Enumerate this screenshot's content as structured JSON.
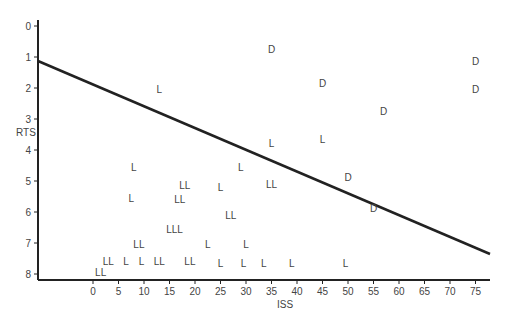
{
  "chart_data": {
    "type": "scatter",
    "title": "",
    "xlabel": "ISS",
    "ylabel": "RTS",
    "xlim": [
      -7,
      78
    ],
    "ylim": [
      8.2,
      -0.2
    ],
    "y_inverted": true,
    "grid": false,
    "legend": null,
    "x_ticks": [
      "0",
      "5",
      "10",
      "15",
      "20",
      "25",
      "30",
      "35",
      "40",
      "45",
      "50",
      "55",
      "60",
      "65",
      "70",
      "75"
    ],
    "y_ticks": [
      "0",
      "1",
      "2",
      "3",
      "4",
      "5",
      "6",
      "7",
      "8"
    ],
    "discriminant_line": {
      "x1": -7,
      "y1": 1.1,
      "x2": 77,
      "y2": 7.3
    },
    "series": [
      {
        "name": "D",
        "points": [
          {
            "x": 35,
            "y": 0.75,
            "label": "D"
          },
          {
            "x": 45,
            "y": 1.85,
            "label": "D"
          },
          {
            "x": 75,
            "y": 1.15,
            "label": "D"
          },
          {
            "x": 75,
            "y": 2.05,
            "label": "D"
          },
          {
            "x": 57,
            "y": 2.75,
            "label": "D"
          },
          {
            "x": 50,
            "y": 4.9,
            "label": "D"
          },
          {
            "x": 55,
            "y": 5.9,
            "label": "D"
          }
        ]
      },
      {
        "name": "L",
        "points": [
          {
            "x": 13,
            "y": 2.05,
            "label": "L"
          },
          {
            "x": 35,
            "y": 3.8,
            "label": "L"
          },
          {
            "x": 45,
            "y": 3.65,
            "label": "L"
          },
          {
            "x": 8,
            "y": 4.55,
            "label": "L"
          },
          {
            "x": 29,
            "y": 4.55,
            "label": "L"
          },
          {
            "x": 18,
            "y": 5.15,
            "label": "LL"
          },
          {
            "x": 25,
            "y": 5.2,
            "label": "L"
          },
          {
            "x": 35,
            "y": 5.1,
            "label": "LL"
          },
          {
            "x": 7.5,
            "y": 5.55,
            "label": "L"
          },
          {
            "x": 17,
            "y": 5.6,
            "label": "LL"
          },
          {
            "x": 27,
            "y": 6.1,
            "label": "LL"
          },
          {
            "x": 16,
            "y": 6.55,
            "label": "LLL"
          },
          {
            "x": 9,
            "y": 7.05,
            "label": "LL"
          },
          {
            "x": 22.5,
            "y": 7.05,
            "label": "L"
          },
          {
            "x": 30,
            "y": 7.05,
            "label": "L"
          },
          {
            "x": 3,
            "y": 7.6,
            "label": "LL"
          },
          {
            "x": 6.5,
            "y": 7.6,
            "label": "L"
          },
          {
            "x": 9.5,
            "y": 7.6,
            "label": "L"
          },
          {
            "x": 13,
            "y": 7.6,
            "label": "LL"
          },
          {
            "x": 19,
            "y": 7.6,
            "label": "LL"
          },
          {
            "x": 25,
            "y": 7.65,
            "label": "L"
          },
          {
            "x": 29.5,
            "y": 7.65,
            "label": "L"
          },
          {
            "x": 33.5,
            "y": 7.65,
            "label": "L"
          },
          {
            "x": 39,
            "y": 7.65,
            "label": "L"
          },
          {
            "x": 49.5,
            "y": 7.65,
            "label": "L"
          },
          {
            "x": 1.5,
            "y": 7.95,
            "label": "LL"
          }
        ]
      }
    ]
  },
  "axes": {
    "xlabel": "ISS",
    "ylabel": "RTS"
  }
}
